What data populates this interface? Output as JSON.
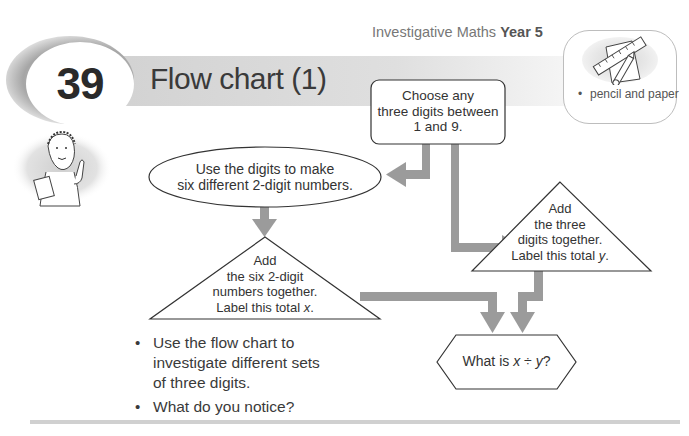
{
  "header": {
    "series": "Investigative Maths",
    "year": "Year 5",
    "activity_number": "39",
    "title": "Flow chart (1)"
  },
  "resources": {
    "icon": "ruler-pencil-paper-icon",
    "items": [
      "pencil and paper"
    ]
  },
  "flowchart": {
    "start_box": {
      "shape": "rounded-rectangle",
      "line1": "Choose any",
      "line2": "three digits between",
      "line3": "1 and 9."
    },
    "ellipse": {
      "shape": "ellipse",
      "line1": "Use the digits to make",
      "line2": "six different 2-digit numbers."
    },
    "triangle_x": {
      "shape": "triangle",
      "line1": "Add",
      "line2": "the six 2-digit",
      "line3": "numbers together.",
      "line4": "Label this total",
      "var": "x",
      "end": "."
    },
    "triangle_y": {
      "shape": "triangle",
      "line1": "Add",
      "line2": "the three",
      "line3": "digits together.",
      "line4": "Label this total",
      "var": "y",
      "end": "."
    },
    "end_hexagon": {
      "shape": "hexagon",
      "prefix": "What is",
      "var1": "x",
      "op": "÷",
      "var2": "y",
      "end": "?"
    },
    "arrow_color": "#9b9b9b"
  },
  "instructions": {
    "bullet1_line1": "Use the flow chart to",
    "bullet1_line2": "investigate different sets",
    "bullet1_line3": "of three digits.",
    "bullet2": "What do you notice?"
  }
}
